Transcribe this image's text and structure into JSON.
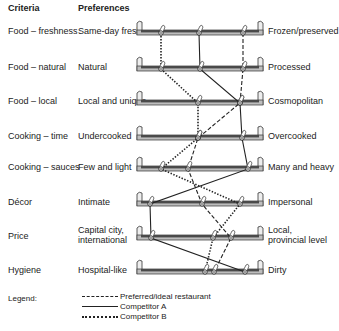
{
  "headers": {
    "criteria": "Criteria",
    "preferences": "Preferences"
  },
  "rows": [
    {
      "criterion": "Food – freshness",
      "left": "Same-day fresh",
      "right": "Frozen/preserved",
      "y": 32
    },
    {
      "criterion": "Food – natural",
      "left": "Natural",
      "right": "Processed",
      "y": 68
    },
    {
      "criterion": "Food – local",
      "left": "Local and unique",
      "right": "Cosmopolitan",
      "y": 102
    },
    {
      "criterion": "Cooking – time",
      "left": "Undercooked",
      "right": "Overcooked",
      "y": 137
    },
    {
      "criterion": "Cooking – sauces",
      "left": "Few and light",
      "right": "Many and heavy",
      "y": 168
    },
    {
      "criterion": "Décor",
      "left": "Intimate",
      "right": "Impersonal",
      "y": 203
    },
    {
      "criterion": "Price",
      "left": "Capital city, international",
      "right": "Local, provincial level",
      "y": 237
    },
    {
      "criterion": "Hygiene",
      "left": "Hospital-like",
      "right": "Dirty",
      "y": 271
    }
  ],
  "legend": {
    "label": "Legend:",
    "items": [
      {
        "style": "dashed",
        "label": "Preferred/ideal restaurant"
      },
      {
        "style": "solid",
        "label": "Competitor A"
      },
      {
        "style": "dotted",
        "label": "Competitor B"
      }
    ]
  },
  "chart_data": {
    "type": "line",
    "title": "",
    "scale_x_px": [
      137,
      263
    ],
    "series": [
      {
        "name": "Preferred/ideal restaurant",
        "style": "dashed",
        "x": [
          243,
          243,
          240,
          198,
          188,
          202,
          231,
          214
        ]
      },
      {
        "name": "Competitor A",
        "style": "solid",
        "x": [
          199,
          200,
          240,
          242,
          248,
          150,
          151,
          245
        ]
      },
      {
        "name": "Competitor B",
        "style": "dotted",
        "x": [
          161,
          161,
          198,
          198,
          161,
          240,
          213,
          205
        ]
      }
    ]
  },
  "colors": {
    "bar_dark": "#4a4a4a",
    "bar_light": "#bdbdbd",
    "line": "#222222"
  }
}
